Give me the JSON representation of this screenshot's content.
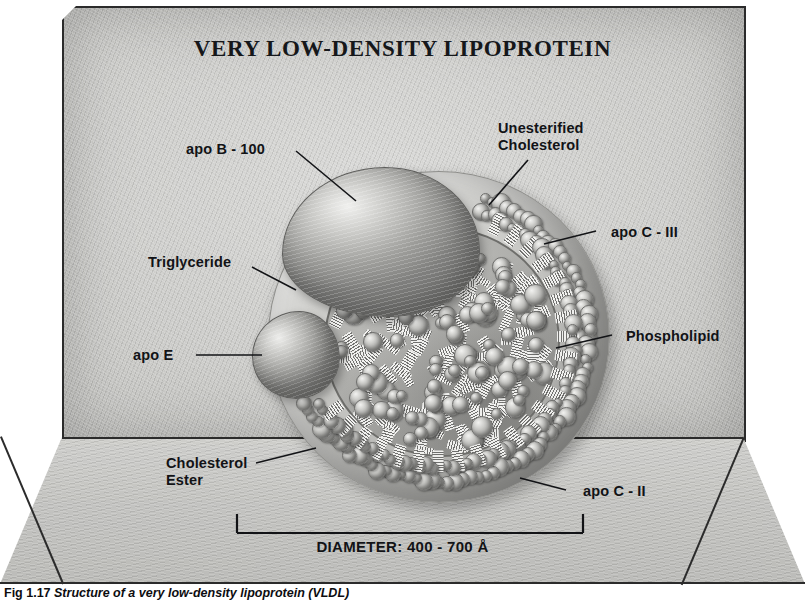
{
  "figure": {
    "title": "VERY LOW-DENSITY LIPOPROTEIN",
    "caption_number": "Fig 1.17",
    "caption_text": "Structure of a very low-density lipoprotein (VLDL)"
  },
  "measurement": {
    "diameter_label": "DIAMETER:  400 - 700 Å",
    "value_min": 400,
    "value_max": 700,
    "unit": "Å"
  },
  "labels": {
    "apo_b100": "apo B - 100",
    "unesterified_cholesterol_line1": "Unesterified",
    "unesterified_cholesterol_line2": "Cholesterol",
    "apo_c3": "apo C - III",
    "phospholipid": "Phospholipid",
    "triglyceride": "Triglyceride",
    "apo_e": "apo E",
    "cholesterol_ester_line1": "Cholesterol",
    "cholesterol_ester_line2": "Ester",
    "apo_c2": "apo C - II"
  },
  "colors": {
    "ink": "#121316",
    "wall": "#cdcdca",
    "floor": "#c6c6c3",
    "outline": "#2b2b2b"
  },
  "components": [
    {
      "name": "apo B-100",
      "type": "apolipoprotein"
    },
    {
      "name": "apo E",
      "type": "apolipoprotein"
    },
    {
      "name": "apo C-II",
      "type": "apolipoprotein"
    },
    {
      "name": "apo C-III",
      "type": "apolipoprotein"
    },
    {
      "name": "Phospholipid",
      "type": "surface lipid"
    },
    {
      "name": "Unesterified Cholesterol",
      "type": "surface lipid"
    },
    {
      "name": "Triglyceride",
      "type": "core lipid"
    },
    {
      "name": "Cholesterol Ester",
      "type": "core lipid"
    }
  ]
}
